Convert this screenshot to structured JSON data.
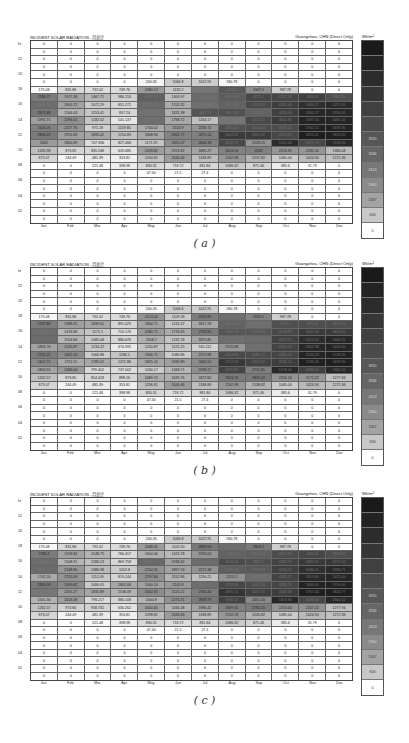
{
  "panels": [
    {
      "id": "a",
      "caption": "( a )",
      "top": 35
    },
    {
      "id": "b",
      "caption": "( b )",
      "top": 262
    },
    {
      "id": "c",
      "caption": "( c )",
      "top": 492
    }
  ],
  "header": {
    "title": "INCIDENT SOLAR RADIATION - 月总计",
    "location": "Guangzhou, CHN (Direct Only)",
    "unit": "Wh/m²"
  },
  "months": [
    "Jan",
    "Feb",
    "Mar",
    "Apr",
    "May",
    "Jun",
    "Jul",
    "Aug",
    "Sep",
    "Oct",
    "Nov",
    "Dec"
  ],
  "hour_labels": [
    "hr",
    "",
    "22",
    "",
    "20",
    "",
    "18",
    "",
    "16",
    "",
    "14",
    "",
    "12",
    "",
    "10",
    "",
    "08",
    "",
    "06",
    "",
    "04",
    "",
    "02",
    ""
  ],
  "legend": {
    "labels": [
      "",
      "",
      "",
      "",
      "",
      "",
      "3920",
      "3266",
      "2613",
      "1960",
      "1307",
      "656",
      "0"
    ],
    "colors": [
      "#1a1a1a",
      "#232323",
      "#2c2c2c",
      "#363636",
      "#404040",
      "#4b4b4b",
      "#575757",
      "#666666",
      "#777777",
      "#8a8a8a",
      "#a3a3a3",
      "#c8c8c8",
      "#ffffff"
    ]
  },
  "chart_data": [
    {
      "type": "heatmap",
      "title": "INCIDENT SOLAR RADIATION - 月总计",
      "subtitle": "Guangzhou, CHN (Direct Only)",
      "xlabel": "Month",
      "ylabel": "Hour",
      "unit": "Wh/m²",
      "categories": [
        "Jan",
        "Feb",
        "Mar",
        "Apr",
        "May",
        "Jun",
        "Jul",
        "Aug",
        "Sep",
        "Oct",
        "Nov",
        "Dec"
      ],
      "rows": [
        [
          "0",
          "0",
          "0",
          "0",
          "0",
          "0",
          "0",
          "0",
          "0",
          "0",
          "0",
          "0"
        ],
        [
          "0",
          "0",
          "0",
          "0",
          "0",
          "0",
          "0",
          "0",
          "0",
          "0",
          "0",
          "0"
        ],
        [
          "0",
          "0",
          "0",
          "0",
          "0",
          "0",
          "0",
          "0",
          "0",
          "0",
          "0",
          "0"
        ],
        [
          "0",
          "0",
          "0",
          "0",
          "0",
          "0",
          "0",
          "0",
          "0",
          "0",
          "0",
          "0"
        ],
        [
          "0",
          "0",
          "0",
          "0",
          "0",
          "0",
          "0",
          "0",
          "0",
          "0",
          "0",
          "0"
        ],
        [
          "0",
          "0",
          "0",
          "0",
          "240.35",
          "1066.8",
          "1022.95",
          "180.78",
          "0",
          "0",
          "0",
          "0"
        ],
        [
          "175.08",
          "831.86",
          "732.02",
          "749.76",
          "2080.12",
          "1132.2",
          "2938.79",
          "3708.4",
          "2307.5",
          "987.78",
          "0",
          "0"
        ],
        [
          "2786.77",
          "1917.38",
          "1467.71",
          "986.153",
          "3496.59",
          "1309.97",
          "3225.81",
          "3575.84",
          "4221.2",
          "4257.58",
          "4414.4",
          "3966.81"
        ],
        [
          "3170.52",
          "1905.72",
          "1072.29",
          "851.272",
          "3246.96",
          "1702.32",
          "3119.92",
          "3461.50",
          "4145.12",
          "4491.46",
          "5084.27",
          "5215.31"
        ],
        [
          "2871.86",
          "1544.43",
          "1153.41",
          "857.24",
          "3061.85",
          "1631.38",
          "3807.74",
          "3907.01",
          "3443.1",
          "4450.58",
          "5360.27",
          "5290.91"
        ],
        [
          "1992.71",
          "2296.01",
          "1182.02",
          "541.137",
          "3144.9",
          "1768.72",
          "1264.17",
          "2959.45",
          "4121.21",
          "4611.80",
          "5587.34",
          "5481.02"
        ],
        [
          "2625.05",
          "2217.76",
          "975.18",
          "1159.85",
          "1744.02",
          "2103.9",
          "2230.72",
          "3905.04",
          "4033.44",
          "4075.21",
          "5702.15",
          "5693.30"
        ],
        [
          "2806.22",
          "1951.83",
          "1835.02",
          "1254.83",
          "1808.94",
          "2601.77",
          "2671.14",
          "4603.32",
          "4621.45",
          "4213.21",
          "5911.02",
          "5823.90"
        ],
        [
          "2062",
          "1800.89",
          "747.336",
          "827.468",
          "1171.92",
          "2325.07",
          "2644.33",
          "4133.95",
          "2228.25",
          "5161.04",
          "4225.79",
          "5214.50"
        ],
        [
          "1335.98",
          "873.85",
          "835.548",
          "626.685",
          "2028.82",
          "1923.82",
          "1885.27",
          "2613.53",
          "2632",
          "2214.91",
          "2181.16",
          "1384.08"
        ],
        [
          "873.07",
          "244.49",
          "481.39",
          "353.81",
          "1294.81",
          "2040.46",
          "1338.89",
          "2162.98",
          "1537.82",
          "1085.04",
          "1424.94",
          "1272.36"
        ],
        [
          "0",
          "0",
          "121.48",
          "398.98",
          "830.31",
          "718.72",
          "831.84",
          "1086.32",
          "871.46",
          "385.6",
          "31.79",
          "0"
        ],
        [
          "0",
          "0",
          "0",
          "0",
          "47.40",
          "21.5",
          "27.4",
          "0",
          "0",
          "0",
          "0",
          "0"
        ],
        [
          "0",
          "0",
          "0",
          "0",
          "0",
          "0",
          "0",
          "0",
          "0",
          "0",
          "0",
          "0"
        ],
        [
          "0",
          "0",
          "0",
          "0",
          "0",
          "0",
          "0",
          "0",
          "0",
          "0",
          "0",
          "0"
        ],
        [
          "0",
          "0",
          "0",
          "0",
          "0",
          "0",
          "0",
          "0",
          "0",
          "0",
          "0",
          "0"
        ],
        [
          "0",
          "0",
          "0",
          "0",
          "0",
          "0",
          "0",
          "0",
          "0",
          "0",
          "0",
          "0"
        ],
        [
          "0",
          "0",
          "0",
          "0",
          "0",
          "0",
          "0",
          "0",
          "0",
          "0",
          "0",
          "0"
        ],
        [
          "0",
          "0",
          "0",
          "0",
          "0",
          "0",
          "0",
          "0",
          "0",
          "0",
          "0",
          "0"
        ]
      ]
    },
    {
      "type": "heatmap",
      "title": "INCIDENT SOLAR RADIATION - 月总计",
      "subtitle": "Guangzhou, CHN (Direct Only)",
      "unit": "Wh/m²",
      "categories": [
        "Jan",
        "Feb",
        "Mar",
        "Apr",
        "May",
        "Jun",
        "Jul",
        "Aug",
        "Sep",
        "Oct",
        "Nov",
        "Dec"
      ],
      "rows": [
        [
          "0",
          "0",
          "0",
          "0",
          "0",
          "0",
          "0",
          "0",
          "0",
          "0",
          "0",
          "0"
        ],
        [
          "0",
          "0",
          "0",
          "0",
          "0",
          "0",
          "0",
          "0",
          "0",
          "0",
          "0",
          "0"
        ],
        [
          "0",
          "0",
          "0",
          "0",
          "0",
          "0",
          "0",
          "0",
          "0",
          "0",
          "0",
          "0"
        ],
        [
          "0",
          "0",
          "0",
          "0",
          "0",
          "0",
          "0",
          "0",
          "0",
          "0",
          "0",
          "0"
        ],
        [
          "0",
          "0",
          "0",
          "0",
          "0",
          "0",
          "0",
          "0",
          "0",
          "0",
          "0",
          "0"
        ],
        [
          "0",
          "0",
          "0",
          "0",
          "240.35",
          "1066.6",
          "1022.95",
          "180.78",
          "0",
          "0",
          "0",
          "0"
        ],
        [
          "175.08",
          "831.86",
          "732.02",
          "749.76",
          "2213.42",
          "1109.28",
          "2742.89",
          "3145.92",
          "2559.5",
          "987.78",
          "0",
          "0"
        ],
        [
          "2707.86",
          "1988.91",
          "1839.61",
          "891.029",
          "1864.71",
          "1132.47",
          "1817.28",
          "3424.39",
          "3148.01",
          "3947.5",
          "3970.4",
          "3978.01"
        ],
        [
          "3170.52",
          "1418.88",
          "1171.1",
          "720.176",
          "2080.71",
          "1718.39",
          "2724.95",
          "3762.29",
          "3739.33",
          "4143.93",
          "4645.00",
          "4614.00"
        ],
        [
          "3220.82",
          "1503.84",
          "1085.08",
          "880.076",
          "1658.7",
          "1232.76",
          "1875.85",
          "3105.33",
          "3221.52",
          "4412.25",
          "5114.25",
          "5340.25"
        ],
        [
          "1894.76",
          "2020.87",
          "1134.22",
          "474.395",
          "1250.87",
          "1121.25",
          "945.211",
          "2155.88",
          "3113.28",
          "4345.05",
          "5302.38",
          "5456.00"
        ],
        [
          "2752.22",
          "2402.20",
          "1066.88",
          "1186.1",
          "1966.71",
          "1080.86",
          "2157.88",
          "4103.85",
          "4085.71",
          "4280.44",
          "5534.23",
          "5708.32"
        ],
        [
          "2407.21",
          "1752.11",
          "1789.02",
          "1221.86",
          "1825.16",
          "1965.89",
          "2445.55",
          "4703.66",
          "4330.22",
          "4530.10",
          "5746.30",
          "5823.90"
        ],
        [
          "1863.91",
          "2084.04",
          "799.402",
          "737.002",
          "1030.17",
          "1468.71",
          "2298.17",
          "4265.80",
          "2711.81",
          "5218.01",
          "4430.10",
          "5300.10"
        ],
        [
          "1262.57",
          "873.85",
          "854.418",
          "898.16",
          "1689.72",
          "1635.76",
          "1877.82",
          "2813.76",
          "2815.02",
          "2256.16",
          "2171.22",
          "1277.84"
        ],
        [
          "873.07",
          "244.49",
          "481.39",
          "353.81",
          "1296.81",
          "2040.46",
          "1338.89",
          "2162.98",
          "1538.82",
          "1085.04",
          "1424.94",
          "1272.36"
        ],
        [
          "0",
          "0",
          "121.48",
          "398.98",
          "830.31",
          "718.72",
          "831.84",
          "1086.32",
          "871.46",
          "385.6",
          "31.79",
          "0"
        ],
        [
          "0",
          "0",
          "0",
          "0",
          "47.40",
          "21.5",
          "27.4",
          "0",
          "0",
          "0",
          "0",
          "0"
        ],
        [
          "0",
          "0",
          "0",
          "0",
          "0",
          "0",
          "0",
          "0",
          "0",
          "0",
          "0",
          "0"
        ],
        [
          "0",
          "0",
          "0",
          "0",
          "0",
          "0",
          "0",
          "0",
          "0",
          "0",
          "0",
          "0"
        ],
        [
          "0",
          "0",
          "0",
          "0",
          "0",
          "0",
          "0",
          "0",
          "0",
          "0",
          "0",
          "0"
        ],
        [
          "0",
          "0",
          "0",
          "0",
          "0",
          "0",
          "0",
          "0",
          "0",
          "0",
          "0",
          "0"
        ],
        [
          "0",
          "0",
          "0",
          "0",
          "0",
          "0",
          "0",
          "0",
          "0",
          "0",
          "0",
          "0"
        ],
        [
          "0",
          "0",
          "0",
          "0",
          "0",
          "0",
          "0",
          "0",
          "0",
          "0",
          "0",
          "0"
        ]
      ]
    },
    {
      "type": "heatmap",
      "title": "INCIDENT SOLAR RADIATION - 月总计",
      "subtitle": "Guangzhou, CHN (Direct Only)",
      "unit": "Wh/m²",
      "categories": [
        "Jan",
        "Feb",
        "Mar",
        "Apr",
        "May",
        "Jun",
        "Jul",
        "Aug",
        "Sep",
        "Oct",
        "Nov",
        "Dec"
      ],
      "rows": [
        [
          "0",
          "0",
          "0",
          "0",
          "0",
          "0",
          "0",
          "0",
          "0",
          "0",
          "0",
          "0"
        ],
        [
          "0",
          "0",
          "0",
          "0",
          "0",
          "0",
          "0",
          "0",
          "0",
          "0",
          "0",
          "0"
        ],
        [
          "0",
          "0",
          "0",
          "0",
          "0",
          "0",
          "0",
          "0",
          "0",
          "0",
          "0",
          "0"
        ],
        [
          "0",
          "0",
          "0",
          "0",
          "0",
          "0",
          "0",
          "0",
          "0",
          "0",
          "0",
          "0"
        ],
        [
          "0",
          "0",
          "0",
          "0",
          "0",
          "0",
          "0",
          "0",
          "0",
          "0",
          "0",
          "0"
        ],
        [
          "0",
          "0",
          "0",
          "0",
          "240.35",
          "1066.8",
          "1022.95",
          "180.78",
          "0",
          "0",
          "0",
          "0"
        ],
        [
          "175.08",
          "831.86",
          "732.02",
          "749.76",
          "2068.31",
          "1109.20",
          "2839.94",
          "3152.34",
          "2809.2",
          "987.78",
          "0",
          "0"
        ],
        [
          "2766.1",
          "1918.84",
          "1548.75",
          "780.417",
          "1604.46",
          "1425.78",
          "2195.02",
          "3448.50",
          "3531.54",
          "4027.31",
          "4202.6",
          "3976.81"
        ],
        [
          "3195.86",
          "1508.91",
          "1286.13",
          "869.758",
          "3255.45",
          "1938.42",
          "3213.50",
          "4131.40",
          "3957.1",
          "4332.75",
          "4690.31",
          "4727.00"
        ],
        [
          "3220.81",
          "2148.80",
          "1386.98",
          "1052.8",
          "2254.31",
          "1897.24",
          "2271.38",
          "3575.93",
          "3713.18",
          "4430.22",
          "5030.21",
          "5230.71"
        ],
        [
          "1742.20",
          "2220.09",
          "1112.09",
          "870.244",
          "2297.80",
          "1552.86",
          "1290.21",
          "2255.2",
          "3172.07",
          "4345.27",
          "5313.66",
          "5415.00"
        ],
        [
          "2816.03",
          "2409.82",
          "1080.05",
          "1801.84",
          "1940.14",
          "2101.8",
          "3124.41",
          "4224.26",
          "4045.56",
          "4260.55",
          "5600.60",
          "5700.60"
        ],
        [
          "2906.46",
          "2092.27",
          "1835.89",
          "1536.09",
          "2402.91",
          "2120.22",
          "2705.44",
          "4865.15",
          "4437.21",
          "4540.38",
          "5767.44",
          "5820.77"
        ],
        [
          "1561.36",
          "2003.08",
          "798.217",
          "880.108",
          "1600.8",
          "2275.31",
          "2858.79",
          "4330.22",
          "2451.00",
          "5303.86",
          "4203.40",
          "5300.10"
        ],
        [
          "1262.57",
          "973.80",
          "958.741",
          "630.262",
          "2000.60",
          "1566.48",
          "1986.42",
          "2699.31",
          "2781.55",
          "2253.64",
          "2267.22",
          "1277.94"
        ],
        [
          "873.07",
          "244.49",
          "481.39",
          "353.81",
          "1298.81",
          "2045.66",
          "1338.89",
          "2132.18",
          "1535.82",
          "1085.04",
          "1424.94",
          "1272.36"
        ],
        [
          "0",
          "0",
          "121.48",
          "398.98",
          "830.31",
          "718.72",
          "831.84",
          "1086.32",
          "871.46",
          "385.6",
          "31.79",
          "0"
        ],
        [
          "0",
          "0",
          "0",
          "0",
          "47.40",
          "21.5",
          "27.4",
          "0",
          "0",
          "0",
          "0",
          "0"
        ],
        [
          "0",
          "0",
          "0",
          "0",
          "0",
          "0",
          "0",
          "0",
          "0",
          "0",
          "0",
          "0"
        ],
        [
          "0",
          "0",
          "0",
          "0",
          "0",
          "0",
          "0",
          "0",
          "0",
          "0",
          "0",
          "0"
        ],
        [
          "0",
          "0",
          "0",
          "0",
          "0",
          "0",
          "0",
          "0",
          "0",
          "0",
          "0",
          "0"
        ],
        [
          "0",
          "0",
          "0",
          "0",
          "0",
          "0",
          "0",
          "0",
          "0",
          "0",
          "0",
          "0"
        ],
        [
          "0",
          "0",
          "0",
          "0",
          "0",
          "0",
          "0",
          "0",
          "0",
          "0",
          "0",
          "0"
        ],
        [
          "0",
          "0",
          "0",
          "0",
          "0",
          "0",
          "0",
          "0",
          "0",
          "0",
          "0",
          "0"
        ]
      ]
    }
  ]
}
